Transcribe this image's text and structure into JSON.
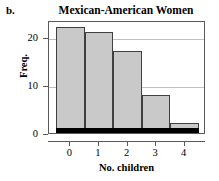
{
  "panel": {
    "letter": "b."
  },
  "chart_data": {
    "type": "bar",
    "title": "Mexican-American Women",
    "xlabel": "No. children",
    "ylabel": "Freq.",
    "categories": [
      "0",
      "1",
      "2",
      "3",
      "4"
    ],
    "values": [
      22,
      21,
      17,
      8,
      2
    ],
    "ylim": [
      0,
      23.5
    ],
    "xlim": [
      -0.75,
      4.75
    ],
    "yticks": [
      0,
      10,
      20
    ],
    "ytick_labels": [
      "0",
      "10",
      "20"
    ],
    "xticks": [
      0,
      1,
      2,
      3,
      4
    ],
    "xtick_labels": [
      "0",
      "1",
      "2",
      "3",
      "4"
    ],
    "grid": "horizontal",
    "legend": "none",
    "bar_fill_color": "#c9c9c9",
    "bar_edge_color": "#404040",
    "baseline_color": "#000000",
    "gridline_color": "#c0c0c0",
    "frame_color": "#5a5a5a"
  }
}
